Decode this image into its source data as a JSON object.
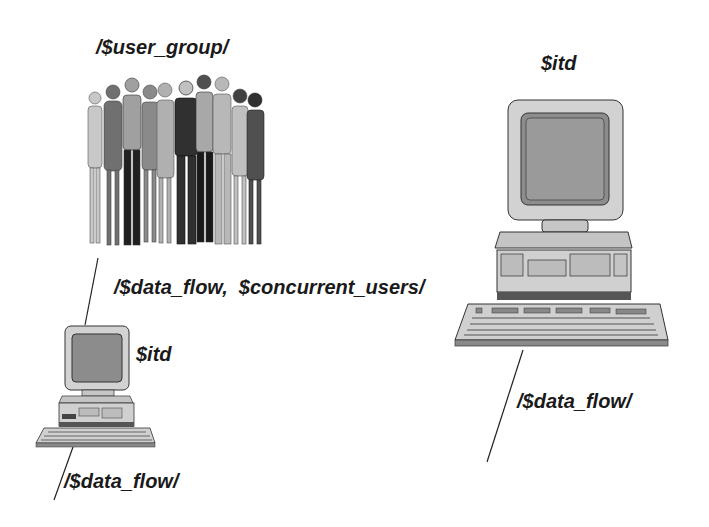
{
  "diagram": {
    "nodes": [
      {
        "id": "user_group",
        "icon": "people-group-icon",
        "label": "/$user_group/"
      },
      {
        "id": "itd_large",
        "icon": "desktop-computer-icon",
        "label": "$itd"
      },
      {
        "id": "itd_small",
        "icon": "desktop-computer-icon",
        "label": "$itd"
      }
    ],
    "edges": [
      {
        "from": "user_group",
        "to": "itd_small",
        "label": "/$data_flow,  $concurrent_users/"
      },
      {
        "from": "itd_small",
        "to": "offscreen",
        "label": "/$data_flow/"
      },
      {
        "from": "itd_large",
        "to": "offscreen",
        "label": "/$data_flow/"
      }
    ]
  },
  "colors": {
    "ink": "#1a1a1a",
    "case": "#d4d4d4",
    "screen": "#8a8a8a",
    "background": "#ffffff"
  }
}
